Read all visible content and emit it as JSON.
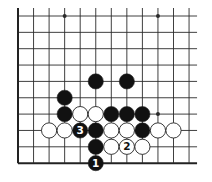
{
  "diagram": {
    "type": "go-board-fragment",
    "grid": {
      "columns": 12,
      "rows": 10,
      "origin_x": 18,
      "origin_y": 16,
      "step_x": 15.55,
      "step_y": 16.35,
      "left_edge": true,
      "bottom_edge": true,
      "line_color": "#2a2a2a",
      "edge_color": "#111111"
    },
    "star_points": [
      {
        "col": 3,
        "row": 0
      },
      {
        "col": 9,
        "row": 0
      },
      {
        "col": 9,
        "row": 6
      }
    ],
    "stones": [
      {
        "color": "black",
        "col": 5,
        "row": 4,
        "label": ""
      },
      {
        "color": "black",
        "col": 7,
        "row": 4,
        "label": ""
      },
      {
        "color": "black",
        "col": 3,
        "row": 5,
        "label": ""
      },
      {
        "color": "black",
        "col": 3,
        "row": 6,
        "label": ""
      },
      {
        "color": "white",
        "col": 4,
        "row": 6,
        "label": ""
      },
      {
        "color": "white",
        "col": 5,
        "row": 6,
        "label": ""
      },
      {
        "color": "black",
        "col": 6,
        "row": 6,
        "label": ""
      },
      {
        "color": "black",
        "col": 7,
        "row": 6,
        "label": ""
      },
      {
        "color": "black",
        "col": 8,
        "row": 6,
        "label": ""
      },
      {
        "color": "white",
        "col": 2,
        "row": 7,
        "label": ""
      },
      {
        "color": "white",
        "col": 3,
        "row": 7,
        "label": ""
      },
      {
        "color": "black",
        "col": 4,
        "row": 7,
        "label": "3"
      },
      {
        "color": "black",
        "col": 5,
        "row": 7,
        "label": ""
      },
      {
        "color": "white",
        "col": 6,
        "row": 7,
        "label": ""
      },
      {
        "color": "white",
        "col": 7,
        "row": 7,
        "label": ""
      },
      {
        "color": "black",
        "col": 8,
        "row": 7,
        "label": ""
      },
      {
        "color": "white",
        "col": 9,
        "row": 7,
        "label": ""
      },
      {
        "color": "white",
        "col": 10,
        "row": 7,
        "label": ""
      },
      {
        "color": "black",
        "col": 5,
        "row": 8,
        "label": ""
      },
      {
        "color": "white",
        "col": 6,
        "row": 8,
        "label": ""
      },
      {
        "color": "white",
        "col": 7,
        "row": 8,
        "label": "2"
      },
      {
        "color": "white",
        "col": 8,
        "row": 8,
        "label": ""
      },
      {
        "color": "black",
        "col": 5,
        "row": 9,
        "label": "1"
      }
    ],
    "colors": {
      "black_stone": "#111111",
      "white_stone": "#ffffff",
      "stone_outline": "#222222",
      "background": "#ffffff"
    }
  }
}
